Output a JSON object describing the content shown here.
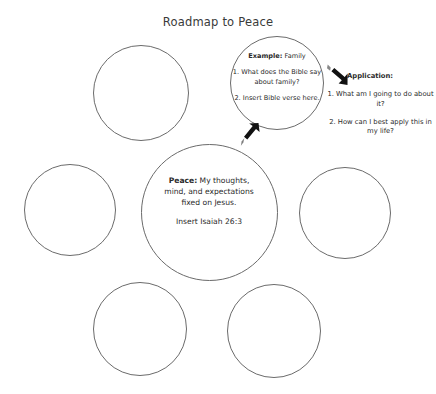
{
  "page": {
    "title": "Roadmap to Peace",
    "background_color": "#ffffff",
    "ink_color": "#2b2b2b",
    "circle_stroke_color": "#6b6b6b"
  },
  "center_circle": {
    "label_bold": "Peace:",
    "line1_rest": " My thoughts,",
    "line2": "mind, and expectations",
    "line3": "fixed on Jesus.",
    "scripture": "Insert Isaiah 26:3"
  },
  "example_circle": {
    "label_bold": "Example:",
    "label_rest": " Family",
    "item1": "1. What does the Bible say about family?",
    "item2": "2. Insert Bible verse here."
  },
  "application": {
    "heading": "Application:",
    "item1": "1. What am I going to do about it?",
    "item2": "2. How can I best apply this in my life?"
  },
  "arrows": {
    "to_example": "arrow-up-right-icon",
    "to_application": "arrow-down-right-icon"
  },
  "blank_circles": [
    {
      "name": "blank-circle-top-left"
    },
    {
      "name": "blank-circle-middle-left"
    },
    {
      "name": "blank-circle-middle-right"
    },
    {
      "name": "blank-circle-bottom-left"
    },
    {
      "name": "blank-circle-bottom-right"
    }
  ]
}
